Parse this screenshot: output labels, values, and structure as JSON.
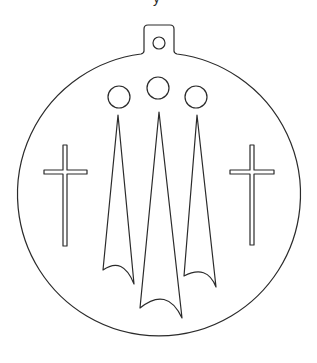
{
  "diagram": {
    "type": "ornament-stencil-outline",
    "background": "#ffffff",
    "stroke_color": "#2b2b2b",
    "cropped_text_fragment": "y",
    "body": {
      "shape": "circle",
      "cx": 158.5,
      "cy": 196,
      "r": 141.5
    },
    "hanger_tab": {
      "x": 144,
      "y": 25,
      "width": 30,
      "height": 28,
      "corner_radius": 4
    },
    "hanger_hole": {
      "cx": 159,
      "cy": 43,
      "r": 6
    },
    "circles": [
      {
        "name": "left",
        "cx": 119,
        "cy": 97,
        "r": 11
      },
      {
        "name": "middle",
        "cx": 158,
        "cy": 88,
        "r": 11
      },
      {
        "name": "right",
        "cx": 196,
        "cy": 97,
        "r": 11
      }
    ],
    "flames": [
      {
        "name": "left",
        "tip": [
          118,
          115
        ],
        "bottom_left": [
          103,
          270
        ],
        "bottom_right": [
          134,
          284
        ],
        "arc_peak_y": 266
      },
      {
        "name": "middle",
        "tip": [
          159,
          112
        ],
        "bottom_left": [
          140,
          308
        ],
        "bottom_right": [
          182,
          318
        ],
        "arc_peak_y": 298
      },
      {
        "name": "right",
        "tip": [
          197,
          115
        ],
        "bottom_left": [
          184,
          276
        ],
        "bottom_right": [
          216,
          287
        ],
        "arc_peak_y": 273
      }
    ],
    "crosses": [
      {
        "name": "left",
        "vertical": {
          "x": 63,
          "y": 145,
          "w": 4,
          "h": 101
        },
        "horizontal": {
          "x": 44,
          "y": 170,
          "w": 43,
          "h": 4
        }
      },
      {
        "name": "right",
        "vertical": {
          "x": 250,
          "y": 145,
          "w": 4,
          "h": 100
        },
        "horizontal": {
          "x": 230,
          "y": 170,
          "w": 44,
          "h": 4
        }
      }
    ]
  }
}
